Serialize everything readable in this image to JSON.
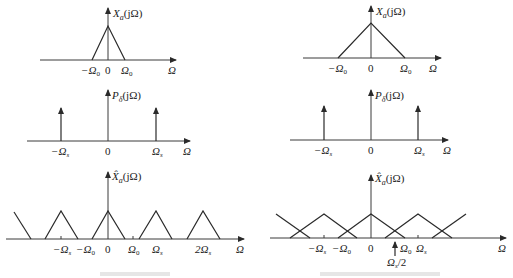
{
  "figure": {
    "panels": [
      {
        "id": "top-left",
        "ylabel": "X_a(jΩ)",
        "ylabel_main": "X",
        "ylabel_sub": "a",
        "ylabel_arg": "(jΩ)",
        "xlabel": "Ω",
        "ticks": [
          "−Ω",
          "0",
          "Ω"
        ],
        "tick_subs": [
          "0",
          "",
          "0"
        ],
        "shape": "triangle",
        "description": "Narrow band-limited spectrum with cutoff Ω0"
      },
      {
        "id": "top-right",
        "ylabel": "X_a(jΩ)",
        "ylabel_main": "X",
        "ylabel_sub": "a",
        "ylabel_arg": "(jΩ)",
        "xlabel": "Ω",
        "ticks": [
          "−Ω",
          "0",
          "Ω"
        ],
        "tick_subs": [
          "0",
          "",
          "0"
        ],
        "shape": "triangle",
        "description": "Wider band-limited spectrum with cutoff Ω0"
      },
      {
        "id": "middle-left",
        "ylabel": "P_δ(jΩ)",
        "ylabel_main": "P",
        "ylabel_sub": "δ",
        "ylabel_arg": "(jΩ)",
        "xlabel": "Ω",
        "ticks": [
          "−Ω",
          "0",
          "Ω"
        ],
        "tick_subs": [
          "s",
          "",
          "s"
        ],
        "shape": "impulse-train"
      },
      {
        "id": "middle-right",
        "ylabel": "P_δ(jΩ)",
        "ylabel_main": "P",
        "ylabel_sub": "δ",
        "ylabel_arg": "(jΩ)",
        "xlabel": "Ω",
        "ticks": [
          "−Ω",
          "0",
          "Ω"
        ],
        "tick_subs": [
          "s",
          "",
          "s"
        ],
        "shape": "impulse-train"
      },
      {
        "id": "bottom-left",
        "ylabel": "X̂_a(jΩ)",
        "ylabel_main": "X̂",
        "ylabel_sub": "a",
        "ylabel_arg": "(jΩ)",
        "xlabel": "Ω",
        "ticks": [
          "−Ω",
          "−Ω",
          "0",
          "Ω",
          "Ω",
          "2Ω"
        ],
        "tick_subs": [
          "s",
          "0",
          "",
          "0",
          "s",
          "s"
        ],
        "shape": "periodic-triangles-no-overlap"
      },
      {
        "id": "bottom-right",
        "ylabel": "X̂_a(jΩ)",
        "ylabel_main": "X̂",
        "ylabel_sub": "a",
        "ylabel_arg": "(jΩ)",
        "xlabel": "Ω",
        "ticks": [
          "−Ω",
          "−Ω",
          "0",
          "Ω",
          "Ω"
        ],
        "tick_subs": [
          "s",
          "0",
          "",
          "0",
          "s"
        ],
        "annotation": "Ω_s/2",
        "annotation_main": "Ω",
        "annotation_sub": "s",
        "annotation_rest": "/2",
        "shape": "periodic-triangles-aliased"
      }
    ],
    "captions": {
      "left": "",
      "right": ""
    }
  }
}
